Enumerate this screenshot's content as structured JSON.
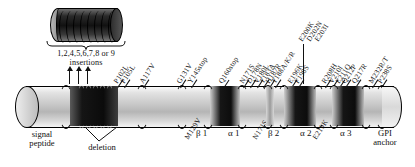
{
  "diagram": {
    "inset": {
      "name": "octapeptide-repeat-region",
      "repeat_count": 9
    },
    "insertion_caption": {
      "line1": "1,2,4,5,6,7,8 or 9",
      "line2": "insertions"
    },
    "deletion_caption": "deletion",
    "signal_peptide_caption": {
      "line1": "signal",
      "line2": "peptide"
    },
    "gpi_caption": {
      "line1": "GPI",
      "line2": "anchor"
    },
    "domains": [
      {
        "label": "β 1",
        "x": 196
      },
      {
        "label": "α 1",
        "x": 228
      },
      {
        "label": "β 2",
        "x": 268
      },
      {
        "label": "α 2",
        "x": 300
      },
      {
        "label": "α 3",
        "x": 340
      }
    ],
    "mutations_above": [
      {
        "label": "P102L",
        "x": 117,
        "y": 76,
        "tick": 10
      },
      {
        "label": "P105L",
        "x": 124,
        "y": 76,
        "tick": 10
      },
      {
        "label": "A117V",
        "x": 143,
        "y": 76,
        "tick": 10
      },
      {
        "label": "G131V",
        "x": 180,
        "y": 76,
        "tick": 10
      },
      {
        "label": "Y145stop",
        "x": 191,
        "y": 76,
        "tick": 10
      },
      {
        "label": "Q160stop",
        "x": 222,
        "y": 76,
        "tick": 12
      },
      {
        "label": "N171S",
        "x": 243,
        "y": 76,
        "tick": 10
      },
      {
        "label": "D178N",
        "x": 250,
        "y": 76,
        "tick": 10
      },
      {
        "label": "V180L",
        "x": 257,
        "y": 76,
        "tick": 10
      },
      {
        "label": "T183A",
        "x": 263,
        "y": 76,
        "tick": 10
      },
      {
        "label": "H187R",
        "x": 269,
        "y": 76,
        "tick": 10
      },
      {
        "label": "T188A/K/R",
        "x": 275,
        "y": 76,
        "tick": 10
      },
      {
        "label": "E196K",
        "x": 291,
        "y": 76,
        "tick": 10
      },
      {
        "label": "F198S",
        "x": 298,
        "y": 76,
        "tick": 10
      },
      {
        "label": "R208H",
        "x": 325,
        "y": 76,
        "tick": 10
      },
      {
        "label": "V210I",
        "x": 332,
        "y": 76,
        "tick": 10
      },
      {
        "label": "E211Q",
        "x": 339,
        "y": 76,
        "tick": 10
      },
      {
        "label": "Q212P",
        "x": 345,
        "y": 76,
        "tick": 10
      },
      {
        "label": "Q217R",
        "x": 355,
        "y": 76,
        "tick": 10
      },
      {
        "label": "M232R/T",
        "x": 372,
        "y": 76,
        "tick": 10
      },
      {
        "label": "P238S",
        "x": 381,
        "y": 76,
        "tick": 10
      }
    ],
    "mutations_stacked": [
      {
        "label": "E200K",
        "x": 304,
        "y": 34
      },
      {
        "label": "D202N",
        "x": 312,
        "y": 34
      },
      {
        "label": "E203I",
        "x": 320,
        "y": 34
      }
    ],
    "mutations_below": [
      {
        "label": "M129V",
        "x": 190,
        "y": 132
      },
      {
        "label": "N171S",
        "x": 258,
        "y": 132
      },
      {
        "label": "E219K",
        "x": 318,
        "y": 132
      }
    ]
  }
}
